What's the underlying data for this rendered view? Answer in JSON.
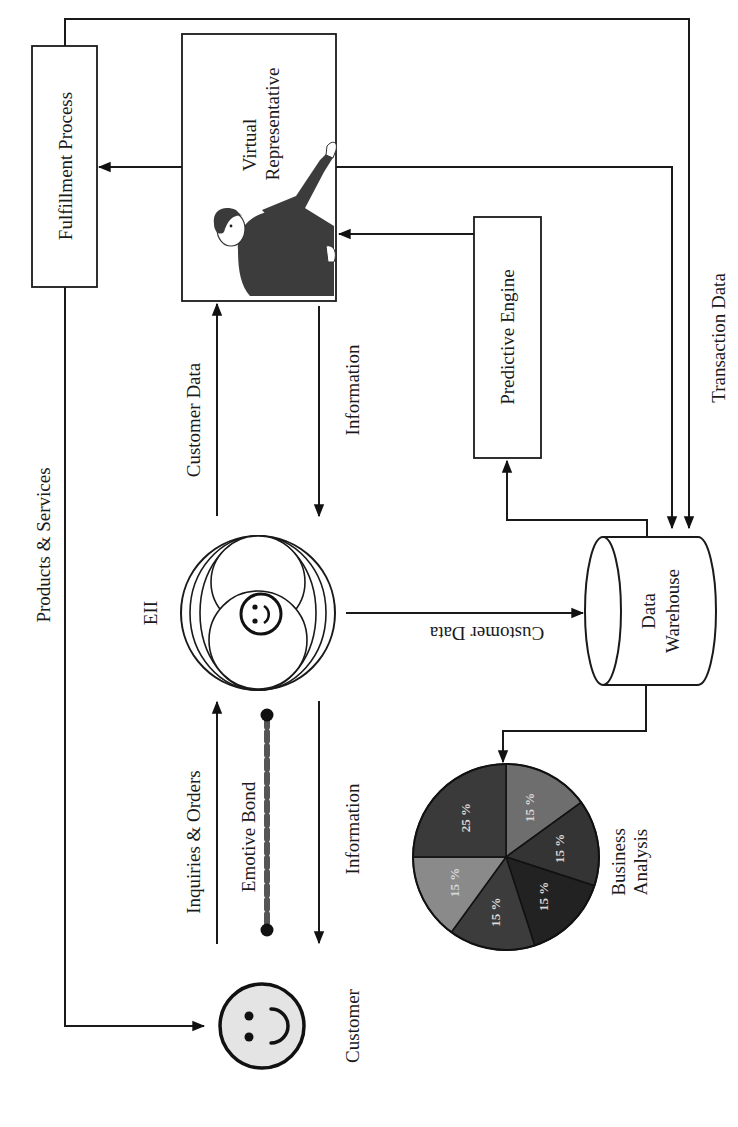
{
  "diagram": {
    "orientation": "rotated-90-ccw",
    "nodes": {
      "fulfillment": {
        "label": "Fulfillment Process"
      },
      "virtual_rep": {
        "label_line1": "Virtual",
        "label_line2": "Representative",
        "image": "person-pointing-illustration"
      },
      "predictive": {
        "label": "Predictive Engine"
      },
      "eii": {
        "label": "EII",
        "icon": "smiley-face-icon"
      },
      "warehouse": {
        "label_line1": "Data",
        "label_line2": "Warehouse",
        "icon": "database-cylinder-icon"
      },
      "customer": {
        "label": "Customer",
        "icon": "smiley-face-icon"
      },
      "business_analysis": {
        "label_line1": "Business",
        "label_line2": "Analysis"
      }
    },
    "edges": {
      "products_services": "Products & Services",
      "customer_data_to_vr": "Customer Data",
      "information_from_vr": "Information",
      "customer_data_to_warehouse": "Customer Data",
      "inquiries_orders": "Inquiries & Orders",
      "emotive_bond": "Emotive Bond",
      "information_to_customer": "Information",
      "transaction_data": "Transaction Data"
    },
    "colors": {
      "line": "#1a1a1a",
      "customer_fill": "#e4e4e4",
      "figure": "#3c3c3c"
    }
  },
  "chart_data": {
    "type": "pie",
    "categories": [
      "Slice 1",
      "Slice 2",
      "Slice 3",
      "Slice 4",
      "Slice 5",
      "Slice 6"
    ],
    "values": [
      15,
      15,
      15,
      15,
      15,
      25
    ],
    "labels": [
      "15 %",
      "15 %",
      "15 %",
      "15 %",
      "15 %",
      "25 %"
    ],
    "colors": [
      "#6e6e6e",
      "#343434",
      "#222222",
      "#3c3c3c",
      "#8a8a8a",
      "#3a3a3a"
    ],
    "start_angle_deg": -90,
    "direction": "clockwise",
    "legend": "none"
  }
}
